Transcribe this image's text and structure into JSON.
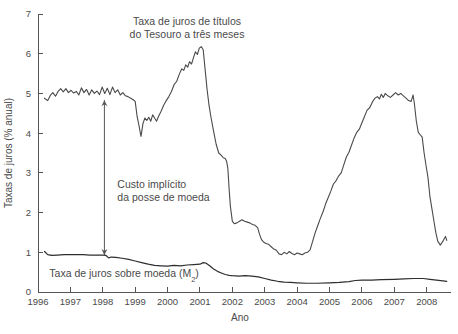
{
  "chart_data": {
    "type": "line",
    "title": "",
    "xlabel": "Ano",
    "ylabel": "Taxas de juros (% anual)",
    "xlim": [
      1996.0,
      2008.75
    ],
    "ylim": [
      0,
      7
    ],
    "yticks": [
      "0",
      "1",
      "2",
      "3",
      "4",
      "5",
      "6",
      "7"
    ],
    "ytick_values": [
      0,
      1,
      2,
      3,
      4,
      5,
      6,
      7
    ],
    "xticks": [
      "1996",
      "1997",
      "1998",
      "1999",
      "2000",
      "2001",
      "2002",
      "2003",
      "2004",
      "2005",
      "2006",
      "2007",
      "2008"
    ],
    "xtick_values": [
      1996,
      1997,
      1998,
      1999,
      2000,
      2001,
      2002,
      2003,
      2004,
      2005,
      2006,
      2007,
      2008
    ],
    "grid": false,
    "legend": "none",
    "annotations": [
      {
        "name": "treasury-bill-label",
        "lines": [
          "Taxa de juros de títulos",
          "do Tesouro a três meses"
        ],
        "x": 2000.6,
        "y": 6.72
      },
      {
        "name": "implicit-cost-label",
        "lines": [
          "Custo implícito",
          "da posse de moeda"
        ],
        "x": 1998.45,
        "y": 2.62
      },
      {
        "name": "money-rate-label",
        "text": "Taxa de juros sobre moeda (M",
        "subscript": "2",
        "suffix": ")",
        "x": 1996.35,
        "y": 0.38
      }
    ],
    "arrow": {
      "name": "implicit-cost-arrow",
      "x": 1998.05,
      "y_top": 4.83,
      "y_bottom": 0.93
    },
    "series": [
      {
        "name": "Taxa de juros de títulos do Tesouro a três meses",
        "color": "#4a4a4a",
        "points": [
          [
            1996.2,
            4.88
          ],
          [
            1996.3,
            4.82
          ],
          [
            1996.38,
            4.95
          ],
          [
            1996.46,
            5.02
          ],
          [
            1996.54,
            4.93
          ],
          [
            1996.62,
            5.05
          ],
          [
            1996.7,
            5.12
          ],
          [
            1996.78,
            5.04
          ],
          [
            1996.86,
            5.12
          ],
          [
            1996.94,
            5.02
          ],
          [
            1997.02,
            5.08
          ],
          [
            1997.1,
            5.01
          ],
          [
            1997.18,
            5.05
          ],
          [
            1997.26,
            4.96
          ],
          [
            1997.34,
            5.14
          ],
          [
            1997.42,
            5.02
          ],
          [
            1997.5,
            5.1
          ],
          [
            1997.58,
            4.96
          ],
          [
            1997.66,
            5.09
          ],
          [
            1997.74,
            5.0
          ],
          [
            1997.82,
            5.06
          ],
          [
            1997.9,
            4.97
          ],
          [
            1997.98,
            5.16
          ],
          [
            1998.06,
            5.0
          ],
          [
            1998.14,
            5.13
          ],
          [
            1998.22,
            4.97
          ],
          [
            1998.3,
            5.16
          ],
          [
            1998.38,
            5.02
          ],
          [
            1998.46,
            5.09
          ],
          [
            1998.54,
            4.96
          ],
          [
            1998.62,
            5.02
          ],
          [
            1998.7,
            4.94
          ],
          [
            1998.78,
            4.92
          ],
          [
            1998.86,
            4.88
          ],
          [
            1998.94,
            4.84
          ],
          [
            1999.0,
            4.8
          ],
          [
            1999.06,
            4.42
          ],
          [
            1999.12,
            4.18
          ],
          [
            1999.18,
            3.92
          ],
          [
            1999.24,
            4.24
          ],
          [
            1999.3,
            4.38
          ],
          [
            1999.36,
            4.32
          ],
          [
            1999.42,
            4.4
          ],
          [
            1999.48,
            4.3
          ],
          [
            1999.54,
            4.46
          ],
          [
            1999.6,
            4.38
          ],
          [
            1999.66,
            4.3
          ],
          [
            1999.72,
            4.42
          ],
          [
            1999.8,
            4.55
          ],
          [
            1999.88,
            4.7
          ],
          [
            1999.96,
            4.82
          ],
          [
            2000.04,
            4.92
          ],
          [
            2000.12,
            5.05
          ],
          [
            2000.2,
            5.22
          ],
          [
            2000.28,
            5.3
          ],
          [
            2000.36,
            5.48
          ],
          [
            2000.44,
            5.62
          ],
          [
            2000.5,
            5.58
          ],
          [
            2000.56,
            5.72
          ],
          [
            2000.62,
            5.66
          ],
          [
            2000.68,
            5.8
          ],
          [
            2000.74,
            5.74
          ],
          [
            2000.8,
            5.9
          ],
          [
            2000.86,
            6.05
          ],
          [
            2000.92,
            5.98
          ],
          [
            2000.98,
            6.14
          ],
          [
            2001.04,
            6.18
          ],
          [
            2001.1,
            6.1
          ],
          [
            2001.16,
            5.6
          ],
          [
            2001.22,
            5.1
          ],
          [
            2001.28,
            4.7
          ],
          [
            2001.34,
            4.4
          ],
          [
            2001.42,
            4.05
          ],
          [
            2001.5,
            3.72
          ],
          [
            2001.58,
            3.5
          ],
          [
            2001.66,
            3.44
          ],
          [
            2001.72,
            3.38
          ],
          [
            2001.78,
            3.36
          ],
          [
            2001.82,
            3.3
          ],
          [
            2001.86,
            3.12
          ],
          [
            2001.9,
            2.6
          ],
          [
            2001.94,
            2.15
          ],
          [
            2002.0,
            1.78
          ],
          [
            2002.06,
            1.72
          ],
          [
            2002.14,
            1.74
          ],
          [
            2002.22,
            1.78
          ],
          [
            2002.3,
            1.82
          ],
          [
            2002.38,
            1.78
          ],
          [
            2002.46,
            1.76
          ],
          [
            2002.54,
            1.74
          ],
          [
            2002.62,
            1.7
          ],
          [
            2002.7,
            1.68
          ],
          [
            2002.78,
            1.62
          ],
          [
            2002.84,
            1.45
          ],
          [
            2002.9,
            1.32
          ],
          [
            2002.96,
            1.26
          ],
          [
            2003.04,
            1.22
          ],
          [
            2003.12,
            1.2
          ],
          [
            2003.2,
            1.14
          ],
          [
            2003.28,
            1.08
          ],
          [
            2003.36,
            1.05
          ],
          [
            2003.44,
            0.96
          ],
          [
            2003.52,
            0.94
          ],
          [
            2003.6,
            1.0
          ],
          [
            2003.68,
            0.96
          ],
          [
            2003.76,
            1.02
          ],
          [
            2003.84,
            0.97
          ],
          [
            2003.92,
            0.94
          ],
          [
            2004.0,
            0.98
          ],
          [
            2004.08,
            0.96
          ],
          [
            2004.16,
            0.94
          ],
          [
            2004.24,
            0.98
          ],
          [
            2004.32,
            1.0
          ],
          [
            2004.4,
            1.06
          ],
          [
            2004.48,
            1.28
          ],
          [
            2004.56,
            1.5
          ],
          [
            2004.64,
            1.68
          ],
          [
            2004.72,
            1.86
          ],
          [
            2004.8,
            2.02
          ],
          [
            2004.88,
            2.22
          ],
          [
            2004.96,
            2.38
          ],
          [
            2005.04,
            2.54
          ],
          [
            2005.12,
            2.72
          ],
          [
            2005.2,
            2.8
          ],
          [
            2005.28,
            2.92
          ],
          [
            2005.36,
            3.0
          ],
          [
            2005.44,
            3.2
          ],
          [
            2005.52,
            3.4
          ],
          [
            2005.6,
            3.52
          ],
          [
            2005.68,
            3.7
          ],
          [
            2005.76,
            3.88
          ],
          [
            2005.84,
            4.02
          ],
          [
            2005.92,
            4.1
          ],
          [
            2006.0,
            4.26
          ],
          [
            2006.08,
            4.42
          ],
          [
            2006.16,
            4.58
          ],
          [
            2006.24,
            4.64
          ],
          [
            2006.32,
            4.78
          ],
          [
            2006.4,
            4.88
          ],
          [
            2006.48,
            4.92
          ],
          [
            2006.54,
            4.86
          ],
          [
            2006.6,
            4.98
          ],
          [
            2006.66,
            4.9
          ],
          [
            2006.72,
            5.0
          ],
          [
            2006.8,
            4.94
          ],
          [
            2006.88,
            4.9
          ],
          [
            2006.96,
            4.96
          ],
          [
            2007.04,
            5.02
          ],
          [
            2007.12,
            4.96
          ],
          [
            2007.2,
            5.0
          ],
          [
            2007.28,
            4.94
          ],
          [
            2007.36,
            4.88
          ],
          [
            2007.44,
            4.82
          ],
          [
            2007.52,
            4.8
          ],
          [
            2007.58,
            4.96
          ],
          [
            2007.62,
            4.74
          ],
          [
            2007.68,
            4.3
          ],
          [
            2007.74,
            4.02
          ],
          [
            2007.8,
            3.96
          ],
          [
            2007.86,
            3.9
          ],
          [
            2007.92,
            3.5
          ],
          [
            2007.98,
            3.18
          ],
          [
            2008.04,
            2.88
          ],
          [
            2008.1,
            2.4
          ],
          [
            2008.16,
            2.1
          ],
          [
            2008.22,
            1.8
          ],
          [
            2008.28,
            1.5
          ],
          [
            2008.34,
            1.28
          ],
          [
            2008.42,
            1.18
          ],
          [
            2008.5,
            1.28
          ],
          [
            2008.58,
            1.4
          ],
          [
            2008.62,
            1.3
          ]
        ]
      },
      {
        "name": "Taxa de juros sobre moeda (M2)",
        "color": "#2e2e2e",
        "points": [
          [
            1996.2,
            1.02
          ],
          [
            1996.3,
            0.94
          ],
          [
            1996.42,
            0.92
          ],
          [
            1996.6,
            0.93
          ],
          [
            1996.8,
            0.94
          ],
          [
            1997.0,
            0.94
          ],
          [
            1997.2,
            0.94
          ],
          [
            1997.4,
            0.94
          ],
          [
            1997.6,
            0.93
          ],
          [
            1997.8,
            0.93
          ],
          [
            1998.0,
            0.93
          ],
          [
            1998.1,
            0.92
          ],
          [
            1998.18,
            0.86
          ],
          [
            1998.26,
            0.88
          ],
          [
            1998.4,
            0.87
          ],
          [
            1998.6,
            0.85
          ],
          [
            1998.8,
            0.82
          ],
          [
            1999.0,
            0.78
          ],
          [
            1999.2,
            0.74
          ],
          [
            1999.4,
            0.7
          ],
          [
            1999.6,
            0.67
          ],
          [
            1999.8,
            0.66
          ],
          [
            2000.0,
            0.65
          ],
          [
            2000.2,
            0.67
          ],
          [
            2000.4,
            0.66
          ],
          [
            2000.6,
            0.68
          ],
          [
            2000.8,
            0.69
          ],
          [
            2001.0,
            0.7
          ],
          [
            2001.1,
            0.74
          ],
          [
            2001.18,
            0.73
          ],
          [
            2001.3,
            0.66
          ],
          [
            2001.42,
            0.58
          ],
          [
            2001.54,
            0.52
          ],
          [
            2001.66,
            0.48
          ],
          [
            2001.78,
            0.44
          ],
          [
            2001.9,
            0.42
          ],
          [
            2002.0,
            0.41
          ],
          [
            2002.2,
            0.4
          ],
          [
            2002.4,
            0.41
          ],
          [
            2002.6,
            0.4
          ],
          [
            2002.8,
            0.38
          ],
          [
            2003.0,
            0.34
          ],
          [
            2003.2,
            0.3
          ],
          [
            2003.4,
            0.27
          ],
          [
            2003.6,
            0.25
          ],
          [
            2003.8,
            0.24
          ],
          [
            2004.0,
            0.23
          ],
          [
            2004.3,
            0.22
          ],
          [
            2004.6,
            0.22
          ],
          [
            2005.0,
            0.23
          ],
          [
            2005.3,
            0.24
          ],
          [
            2005.6,
            0.26
          ],
          [
            2005.8,
            0.29
          ],
          [
            2006.0,
            0.3
          ],
          [
            2006.3,
            0.3
          ],
          [
            2006.6,
            0.31
          ],
          [
            2007.0,
            0.32
          ],
          [
            2007.3,
            0.33
          ],
          [
            2007.6,
            0.34
          ],
          [
            2007.9,
            0.34
          ],
          [
            2008.1,
            0.32
          ],
          [
            2008.3,
            0.3
          ],
          [
            2008.5,
            0.28
          ],
          [
            2008.62,
            0.27
          ]
        ]
      }
    ]
  }
}
